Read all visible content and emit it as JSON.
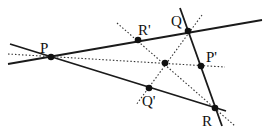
{
  "diagram": {
    "type": "geometry-concurrency",
    "points": {
      "P": {
        "label": "P",
        "x": 51,
        "y": 57,
        "lx": 40,
        "ly": 53
      },
      "Q": {
        "label": "Q",
        "x": 188,
        "y": 31,
        "lx": 171,
        "ly": 26
      },
      "R": {
        "label": "R",
        "x": 215,
        "y": 108,
        "lx": 202,
        "ly": 126
      },
      "Rp": {
        "label": "R'",
        "x": 138,
        "y": 40,
        "lx": 138,
        "ly": 35
      },
      "Pp": {
        "label": "P'",
        "x": 201,
        "y": 66,
        "lx": 206,
        "ly": 62
      },
      "Qp": {
        "label": "Q'",
        "x": 149,
        "y": 88,
        "lx": 142,
        "ly": 106
      },
      "O": {
        "label": "",
        "x": 165,
        "y": 63
      }
    },
    "solid_lines": [
      {
        "name": "line-PQ",
        "x1": 8,
        "y1": 64,
        "x2": 262,
        "y2": 20
      },
      {
        "name": "line-PR",
        "x1": 10,
        "y1": 44,
        "x2": 226,
        "y2": 111
      },
      {
        "name": "line-QR",
        "x1": 180,
        "y1": 8,
        "x2": 222,
        "y2": 126
      }
    ],
    "dotted_lines": [
      {
        "name": "cevian-P-Pp",
        "x1": 8,
        "y1": 54,
        "x2": 225,
        "y2": 67
      },
      {
        "name": "cevian-Q-Qp",
        "x1": 202,
        "y1": 15,
        "x2": 136,
        "y2": 105
      },
      {
        "name": "cevian-R-Rp",
        "x1": 117,
        "y1": 23,
        "x2": 235,
        "y2": 126
      }
    ]
  }
}
